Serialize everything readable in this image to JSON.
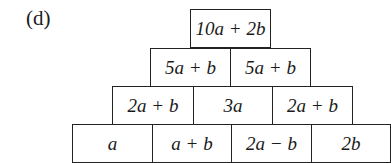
{
  "label": "(d)",
  "pyramid": {
    "rows": [
      [
        "10a + 2b"
      ],
      [
        "5a + b",
        "5a + b"
      ],
      [
        "2a + b",
        "3a",
        "2a + b"
      ],
      [
        "a",
        "a + b",
        "2a − b",
        "2b"
      ]
    ]
  }
}
